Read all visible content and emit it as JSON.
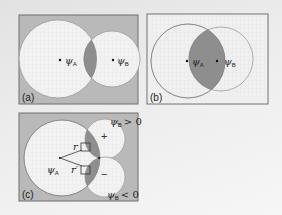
{
  "figure": {
    "panels": [
      {
        "id": "a",
        "label": "(a)",
        "description": "Two atomic orbitals far apart with small overlap",
        "orbital_a": {
          "symbol": "ψ",
          "subscript": "A"
        },
        "orbital_b": {
          "symbol": "ψ",
          "subscript": "B"
        }
      },
      {
        "id": "b",
        "label": "(b)",
        "description": "Two atomic orbitals close together with large overlap",
        "orbital_a": {
          "symbol": "ψ",
          "subscript": "A"
        },
        "orbital_b": {
          "symbol": "ψ",
          "subscript": "B"
        }
      },
      {
        "id": "c",
        "label": "(c)",
        "description": "s orbital overlapping p orbital; positive and negative lobes cancel",
        "orbital_a": {
          "symbol": "ψ",
          "subscript": "A"
        },
        "top_condition": {
          "symbol": "ψ",
          "subscript": "B",
          "relation": "> 0"
        },
        "bottom_condition": {
          "symbol": "ψ",
          "subscript": "B",
          "relation": "< 0"
        },
        "plus_sign": "+",
        "minus_sign": "−",
        "distance_labels": {
          "r": "r",
          "r_prime": "r′"
        }
      }
    ],
    "colors": {
      "panel_gray_bg": "#b9b9b9",
      "panel_light_bg": "#f0f0f0",
      "orbital_fill": "#f2f2f2",
      "overlap_fill": "#8e8e8e",
      "outline": "#8a8a8a",
      "frame": "#6f6f6f"
    }
  }
}
